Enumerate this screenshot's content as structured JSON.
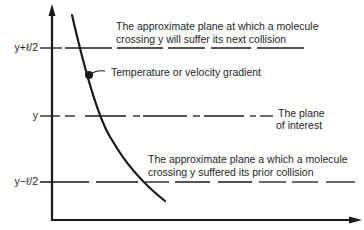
{
  "diagram": {
    "y_axis_ticks": {
      "upper": "y+ℓ/2",
      "middle": "y",
      "lower": "y−ℓ/2"
    },
    "annotations": {
      "upper_plane_line1": "The approximate plane at which a molecule",
      "upper_plane_line2": "crossing y will suffer its next collision",
      "gradient": "Temperature or velocity gradient",
      "plane_interest_line1": "The plane",
      "plane_interest_line2": "of interest",
      "lower_plane_line1": "The approximate plane a which a molecule",
      "lower_plane_line2": "crossing y suffered its prior collision"
    },
    "colors": {
      "ink": "#1a1a1a",
      "background": "#ffffff"
    }
  }
}
